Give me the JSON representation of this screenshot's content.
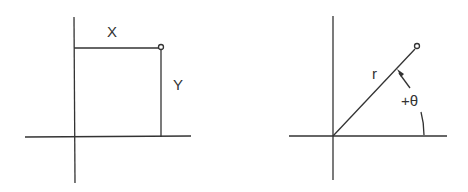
{
  "diagrams": {
    "cartesian": {
      "labels": {
        "x": "X",
        "y": "Y"
      }
    },
    "polar": {
      "labels": {
        "r": "r",
        "theta": "+θ"
      }
    }
  },
  "colors": {
    "stroke": "#333333",
    "background": "#ffffff"
  }
}
